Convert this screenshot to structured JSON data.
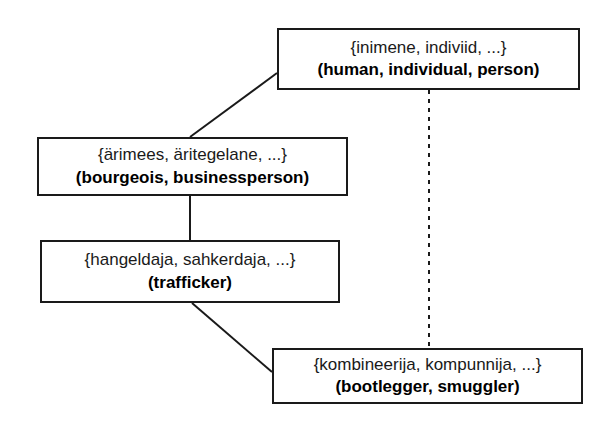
{
  "diagram": {
    "type": "semantic-network",
    "nodes": [
      {
        "id": "human",
        "estonian": "{inimene, indiviid, ...}",
        "english": "(human, individual, person)"
      },
      {
        "id": "bourgeois",
        "estonian": "{ärimees, äritegelane, ...}",
        "english": "(bourgeois, businessperson)"
      },
      {
        "id": "trafficker",
        "estonian": "{hangeldaja, sahkerdaja, ...}",
        "english": "(trafficker)"
      },
      {
        "id": "bootlegger",
        "estonian": "{kombineerija, kompunnija, ...}",
        "english": "(bootlegger, smuggler)"
      }
    ],
    "edges": [
      {
        "id": "human-bourgeois",
        "from": "human",
        "to": "bourgeois",
        "style": "solid"
      },
      {
        "id": "bourgeois-trafficker",
        "from": "bourgeois",
        "to": "trafficker",
        "style": "solid"
      },
      {
        "id": "trafficker-bootlegger",
        "from": "trafficker",
        "to": "bootlegger",
        "style": "solid"
      },
      {
        "id": "human-bootlegger",
        "from": "human",
        "to": "bootlegger",
        "style": "dashed"
      }
    ],
    "colors": {
      "line": "#1a1a1a",
      "border": "#1a1a1a",
      "background": "#ffffff",
      "text": "#1a1a1a"
    }
  }
}
